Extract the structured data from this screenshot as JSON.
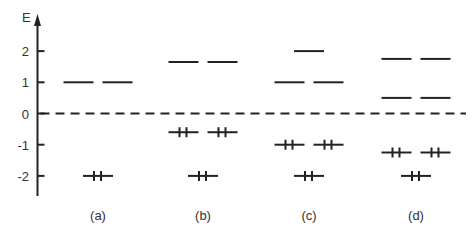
{
  "diagram": {
    "type": "energy-level-diagram",
    "axis": {
      "label": "E",
      "ticks": [
        2,
        1,
        0,
        -1,
        -2
      ],
      "tick_labels": [
        "2",
        "1",
        "0",
        "-1",
        "-2"
      ],
      "range": [
        -2.5,
        2.7
      ]
    },
    "reference_line": {
      "energy": 0,
      "style": "dashed"
    },
    "panels": [
      {
        "label": "(a)",
        "levels": [
          {
            "energy": 1,
            "slots": [
              "left",
              "right"
            ],
            "electrons": 0
          },
          {
            "energy": -2,
            "slots": [
              "center"
            ],
            "electrons": 2
          }
        ]
      },
      {
        "label": "(b)",
        "levels": [
          {
            "energy": 1.65,
            "slots": [
              "left",
              "right"
            ],
            "electrons": 0
          },
          {
            "energy": -0.6,
            "slots": [
              "left",
              "right"
            ],
            "electrons": 2
          },
          {
            "energy": -2,
            "slots": [
              "center"
            ],
            "electrons": 2
          }
        ]
      },
      {
        "label": "(c)",
        "levels": [
          {
            "energy": 2,
            "slots": [
              "center"
            ],
            "electrons": 0
          },
          {
            "energy": 1,
            "slots": [
              "left",
              "right"
            ],
            "electrons": 0
          },
          {
            "energy": -1,
            "slots": [
              "left",
              "right"
            ],
            "electrons": 2
          },
          {
            "energy": -2,
            "slots": [
              "center"
            ],
            "electrons": 2
          }
        ]
      },
      {
        "label": "(d)",
        "levels": [
          {
            "energy": 1.75,
            "slots": [
              "left",
              "right"
            ],
            "electrons": 0
          },
          {
            "energy": 0.5,
            "slots": [
              "left",
              "right"
            ],
            "electrons": 0
          },
          {
            "energy": -1.25,
            "slots": [
              "left",
              "right"
            ],
            "electrons": 2
          },
          {
            "energy": -2,
            "slots": [
              "center"
            ],
            "electrons": 2
          }
        ]
      }
    ]
  }
}
